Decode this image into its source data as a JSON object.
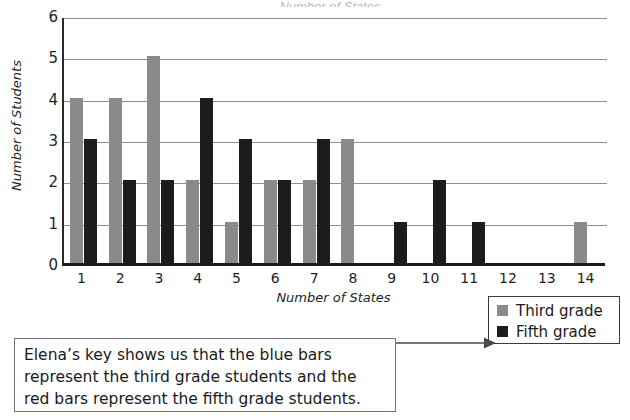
{
  "chart_data": {
    "type": "bar",
    "title": "",
    "xlabel": "Number of States",
    "ylabel": "Number of Students",
    "categories": [
      "1",
      "2",
      "3",
      "4",
      "5",
      "6",
      "7",
      "8",
      "9",
      "10",
      "11",
      "12",
      "13",
      "14"
    ],
    "series": [
      {
        "name": "Third grade",
        "color": "#8a8a8a",
        "values": [
          4,
          4,
          5,
          2,
          1,
          2,
          2,
          3,
          0,
          0,
          0,
          0,
          0,
          1
        ]
      },
      {
        "name": "Fifth grade",
        "color": "#1c1c1c",
        "values": [
          3,
          2,
          2,
          4,
          3,
          2,
          3,
          0,
          1,
          2,
          1,
          0,
          0,
          0
        ]
      }
    ],
    "ylim": [
      0,
      6
    ],
    "yticks": [
      "0",
      "1",
      "2",
      "3",
      "4",
      "5",
      "6"
    ],
    "grid": "horizontal",
    "legend_position": "bottom-right"
  },
  "title_sliver": "Number of States",
  "legend": {
    "items": [
      {
        "label": "Third grade",
        "swatch": "third"
      },
      {
        "label": "Fifth grade",
        "swatch": "fifth"
      }
    ]
  },
  "caption": {
    "line1": "Elena’s key shows us that the blue bars",
    "line2": "represent the third grade students and the",
    "line3": "red bars represent the fifth grade students."
  }
}
